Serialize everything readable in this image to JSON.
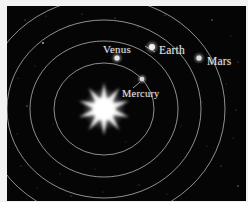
{
  "figure": {
    "frame_color": "#f2f2f2",
    "sky_color": "#050505",
    "orbit_color": "#b9b9b9",
    "label_color": "#e8e8e8",
    "sun_color": "#ffffff"
  },
  "sun": {
    "name": "Sun",
    "cx": 97,
    "cy": 103,
    "points": 10,
    "outer_radius": 26,
    "inner_radius": 10,
    "glow_radius": 22
  },
  "orbits": [
    {
      "name": "mercury-orbit",
      "cx": 97,
      "cy": 103,
      "rx": 50,
      "ry": 46
    },
    {
      "name": "venus-orbit",
      "cx": 97,
      "cy": 103,
      "rx": 74,
      "ry": 68
    },
    {
      "name": "earth-orbit",
      "cx": 97,
      "cy": 103,
      "rx": 97,
      "ry": 89
    },
    {
      "name": "mars-orbit",
      "cx": 97,
      "cy": 103,
      "rx": 121,
      "ry": 111
    }
  ],
  "planets": [
    {
      "id": "mercury",
      "label": "Mercury",
      "dot_x": 135,
      "dot_y": 73,
      "dot_r": 2.3,
      "dot_color": "#d8d8d8",
      "label_x": 115,
      "label_y": 82,
      "font_size": 10.5,
      "leader": {
        "x1": 133,
        "y1": 76,
        "x2": 126,
        "y2": 82
      }
    },
    {
      "id": "venus",
      "label": "Venus",
      "dot_x": 110,
      "dot_y": 52,
      "dot_r": 2.6,
      "dot_color": "#e6e6e6",
      "label_x": 96,
      "label_y": 37,
      "font_size": 11,
      "leader": {
        "x1": 138,
        "y1": 40,
        "x2": 148,
        "y2": 46
      }
    },
    {
      "id": "earth",
      "label": "Earth",
      "dot_x": 145,
      "dot_y": 41,
      "dot_r": 3.0,
      "dot_color": "#f0f0f0",
      "label_x": 152,
      "label_y": 38,
      "font_size": 11.5,
      "leader": null
    },
    {
      "id": "mars",
      "label": "Mars",
      "dot_x": 192,
      "dot_y": 52,
      "dot_r": 2.6,
      "dot_color": "#e0e0e0",
      "label_x": 200,
      "label_y": 49,
      "font_size": 11.5,
      "leader": null
    }
  ],
  "stars": [
    {
      "x": 18,
      "y": 14,
      "r": 0.6,
      "o": 0.55
    },
    {
      "x": 39,
      "y": 10,
      "r": 0.5,
      "o": 0.4
    },
    {
      "x": 62,
      "y": 19,
      "r": 0.5,
      "o": 0.35
    },
    {
      "x": 36,
      "y": 37,
      "r": 0.9,
      "o": 0.75
    },
    {
      "x": 75,
      "y": 8,
      "r": 0.5,
      "o": 0.45
    },
    {
      "x": 108,
      "y": 12,
      "r": 0.6,
      "o": 0.5
    },
    {
      "x": 131,
      "y": 21,
      "r": 0.5,
      "o": 0.35
    },
    {
      "x": 158,
      "y": 9,
      "r": 0.6,
      "o": 0.45
    },
    {
      "x": 182,
      "y": 24,
      "r": 0.5,
      "o": 0.4
    },
    {
      "x": 205,
      "y": 14,
      "r": 0.7,
      "o": 0.55
    },
    {
      "x": 224,
      "y": 30,
      "r": 0.5,
      "o": 0.35
    },
    {
      "x": 231,
      "y": 56,
      "r": 0.6,
      "o": 0.45
    },
    {
      "x": 219,
      "y": 78,
      "r": 0.5,
      "o": 0.3
    },
    {
      "x": 229,
      "y": 104,
      "r": 0.6,
      "o": 0.4
    },
    {
      "x": 226,
      "y": 132,
      "r": 0.5,
      "o": 0.35
    },
    {
      "x": 214,
      "y": 160,
      "r": 0.6,
      "o": 0.45
    },
    {
      "x": 231,
      "y": 180,
      "r": 0.7,
      "o": 0.55
    },
    {
      "x": 188,
      "y": 178,
      "r": 0.5,
      "o": 0.35
    },
    {
      "x": 160,
      "y": 188,
      "r": 0.5,
      "o": 0.3
    },
    {
      "x": 132,
      "y": 179,
      "r": 0.6,
      "o": 0.4
    },
    {
      "x": 96,
      "y": 186,
      "r": 0.5,
      "o": 0.35
    },
    {
      "x": 64,
      "y": 190,
      "r": 0.6,
      "o": 0.45
    },
    {
      "x": 30,
      "y": 182,
      "r": 0.5,
      "o": 0.35
    },
    {
      "x": 14,
      "y": 160,
      "r": 0.6,
      "o": 0.4
    },
    {
      "x": 10,
      "y": 128,
      "r": 0.5,
      "o": 0.3
    },
    {
      "x": 20,
      "y": 100,
      "r": 0.7,
      "o": 0.5
    },
    {
      "x": 11,
      "y": 72,
      "r": 0.5,
      "o": 0.35
    },
    {
      "x": 28,
      "y": 60,
      "r": 0.5,
      "o": 0.3
    },
    {
      "x": 53,
      "y": 168,
      "r": 0.5,
      "o": 0.3
    },
    {
      "x": 174,
      "y": 120,
      "r": 0.5,
      "o": 0.3
    },
    {
      "x": 195,
      "y": 96,
      "r": 0.5,
      "o": 0.28
    },
    {
      "x": 150,
      "y": 150,
      "r": 0.5,
      "o": 0.28
    },
    {
      "x": 88,
      "y": 163,
      "r": 0.5,
      "o": 0.28
    },
    {
      "x": 119,
      "y": 136,
      "r": 0.5,
      "o": 0.25
    },
    {
      "x": 46,
      "y": 118,
      "r": 0.5,
      "o": 0.28
    },
    {
      "x": 200,
      "y": 140,
      "r": 0.5,
      "o": 0.3
    }
  ]
}
